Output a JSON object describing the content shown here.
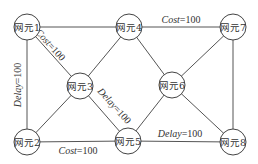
{
  "diagram": {
    "type": "network-topology",
    "nodes": [
      {
        "id": "n1",
        "label": "网元1",
        "x": 27,
        "y": 27
      },
      {
        "id": "n4",
        "label": "网元4",
        "x": 129,
        "y": 27
      },
      {
        "id": "n7",
        "label": "网元7",
        "x": 233,
        "y": 27
      },
      {
        "id": "n3",
        "label": "网元3",
        "x": 80,
        "y": 86
      },
      {
        "id": "n6",
        "label": "网元6",
        "x": 172,
        "y": 85
      },
      {
        "id": "n2",
        "label": "网元2",
        "x": 27,
        "y": 142
      },
      {
        "id": "n5",
        "label": "网元5",
        "x": 128,
        "y": 141
      },
      {
        "id": "n8",
        "label": "网元8",
        "x": 233,
        "y": 142
      }
    ],
    "edges": [
      {
        "from": "n1",
        "to": "n4",
        "label": ""
      },
      {
        "from": "n1",
        "to": "n3",
        "label": "Cost=100"
      },
      {
        "from": "n1",
        "to": "n2",
        "label": "Delay=100"
      },
      {
        "from": "n4",
        "to": "n3",
        "label": ""
      },
      {
        "from": "n4",
        "to": "n7",
        "label": "Cost=100"
      },
      {
        "from": "n4",
        "to": "n6",
        "label": ""
      },
      {
        "from": "n7",
        "to": "n6",
        "label": ""
      },
      {
        "from": "n7",
        "to": "n8",
        "label": ""
      },
      {
        "from": "n3",
        "to": "n2",
        "label": ""
      },
      {
        "from": "n3",
        "to": "n5",
        "label": "Delay=100"
      },
      {
        "from": "n2",
        "to": "n5",
        "label": "Cost=100"
      },
      {
        "from": "n6",
        "to": "n5",
        "label": ""
      },
      {
        "from": "n6",
        "to": "n8",
        "label": ""
      },
      {
        "from": "n5",
        "to": "n8",
        "label": "Delay=100"
      }
    ],
    "edge_labels": {
      "n1_n3": {
        "metric": "Cost",
        "value": "=100"
      },
      "n1_n2": {
        "metric": "Delay",
        "value": "=100"
      },
      "n4_n7": {
        "metric": "Cost",
        "value": "=100"
      },
      "n3_n5": {
        "metric": "Delay",
        "value": "=100"
      },
      "n2_n5": {
        "metric": "Cost",
        "value": "=100"
      },
      "n5_n8": {
        "metric": "Delay",
        "value": "=100"
      }
    },
    "colors": {
      "line": "#555555",
      "node_stroke": "#444444",
      "text": "#333333",
      "background": "#ffffff"
    }
  }
}
